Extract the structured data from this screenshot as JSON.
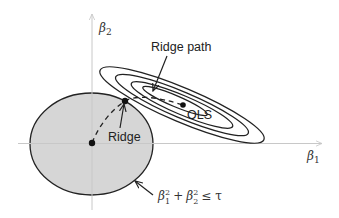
{
  "diagram": {
    "type": "ridge-regression-geometry",
    "axes": {
      "x_label": "β",
      "x_label_sub": "1",
      "y_label": "β",
      "y_label_sub": "2",
      "axis_color": "#c8c8c8"
    },
    "constraint_region": {
      "label_b1": "β",
      "label_b1_sub": "1",
      "label_b1_sup": "2",
      "label_plus": "+",
      "label_b2": "β",
      "label_b2_sub": "2",
      "label_b2_sup": "2",
      "label_rel": "≤ τ",
      "fill_color": "#d6d6d6",
      "stroke_color": "#222222"
    },
    "labels": {
      "ridge_path": "Ridge path",
      "ols": "OLS",
      "ridge": "Ridge"
    },
    "contours": {
      "count": 4,
      "stroke_color": "#222222"
    }
  }
}
